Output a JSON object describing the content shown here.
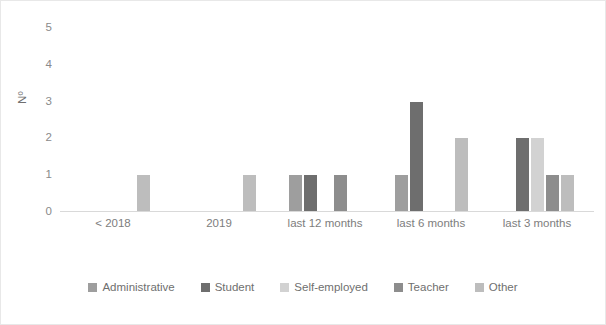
{
  "chart_data": {
    "type": "bar",
    "title": "",
    "subtitle": "",
    "xlabel": "",
    "ylabel": "Nº",
    "categories": [
      "< 2018",
      "2019",
      "last 12 months",
      "last 6 months",
      "last 3 months"
    ],
    "series": [
      {
        "name": "Administrative",
        "color": "#9e9e9e",
        "values": [
          0,
          0,
          1,
          1,
          0
        ]
      },
      {
        "name": "Student",
        "color": "#6e6e6e",
        "values": [
          0,
          0,
          1,
          3,
          2
        ]
      },
      {
        "name": "Self-employed",
        "color": "#d2d2d2",
        "values": [
          0,
          0,
          0,
          0,
          2
        ]
      },
      {
        "name": "Teacher",
        "color": "#8d8d8d",
        "values": [
          0,
          0,
          1,
          0,
          1
        ]
      },
      {
        "name": "Other",
        "color": "#bdbdbd",
        "values": [
          1,
          1,
          0,
          2,
          1
        ]
      }
    ],
    "ylim": [
      0,
      5
    ],
    "yticks": [
      "0",
      "1",
      "2",
      "3",
      "4",
      "5"
    ],
    "grid": false,
    "legend_position": "bottom",
    "annotations": []
  },
  "axis": {
    "y_title": "Nº",
    "y_ticks": [
      "0",
      "1",
      "2",
      "3",
      "4",
      "5"
    ]
  },
  "legend": {
    "items": [
      {
        "label": "Administrative",
        "swatch": "legend-swatch-administrative",
        "color": "#9e9e9e"
      },
      {
        "label": "Student",
        "swatch": "legend-swatch-student",
        "color": "#6e6e6e"
      },
      {
        "label": "Self-employed",
        "swatch": "legend-swatch-self-employed",
        "color": "#d2d2d2"
      },
      {
        "label": "Teacher",
        "swatch": "legend-swatch-teacher",
        "color": "#8d8d8d"
      },
      {
        "label": "Other",
        "swatch": "legend-swatch-other",
        "color": "#bdbdbd"
      }
    ]
  }
}
